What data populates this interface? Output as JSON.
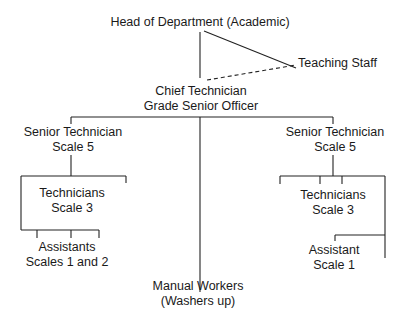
{
  "diagram": {
    "type": "organization-chart",
    "nodes": {
      "head": {
        "line1": "Head of Department (Academic)"
      },
      "teaching": {
        "line1": "Teaching Staff"
      },
      "chief": {
        "line1": "Chief Technician",
        "line2": "Grade Senior Officer"
      },
      "senior_left": {
        "line1": "Senior Technician",
        "line2": "Scale 5"
      },
      "senior_right": {
        "line1": "Senior Technician",
        "line2": "Scale 5"
      },
      "tech_left": {
        "line1": "Technicians",
        "line2": "Scale 3"
      },
      "tech_right": {
        "line1": "Technicians",
        "line2": "Scale 3"
      },
      "assist_left": {
        "line1": "Assistants",
        "line2": "Scales 1 and 2"
      },
      "assist_right": {
        "line1": "Assistant",
        "line2": "Scale 1"
      },
      "manual": {
        "line1": "Manual Workers",
        "line2": "(Washers up)"
      }
    },
    "edges": [
      {
        "from": "head",
        "to": "chief",
        "style": "solid"
      },
      {
        "from": "head",
        "to": "teaching",
        "style": "solid"
      },
      {
        "from": "chief",
        "to": "teaching",
        "style": "dashed"
      },
      {
        "from": "chief",
        "to": "senior_left",
        "style": "solid"
      },
      {
        "from": "chief",
        "to": "senior_right",
        "style": "solid"
      },
      {
        "from": "chief",
        "to": "manual",
        "style": "solid"
      },
      {
        "from": "senior_left",
        "to": "tech_left",
        "style": "solid"
      },
      {
        "from": "tech_left",
        "to": "assist_left",
        "style": "solid"
      },
      {
        "from": "senior_right",
        "to": "tech_right",
        "style": "solid"
      },
      {
        "from": "tech_right",
        "to": "assist_right",
        "style": "solid"
      }
    ],
    "line_color": "#222222"
  }
}
